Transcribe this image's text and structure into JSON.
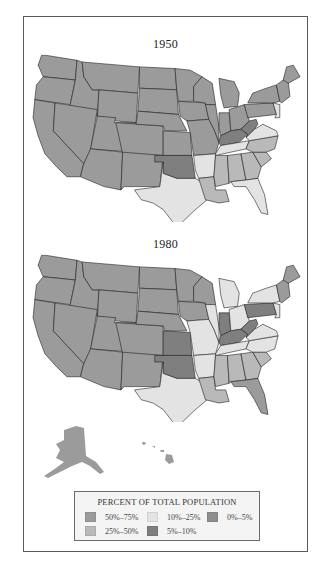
{
  "figure": {
    "maps": [
      {
        "title": "1950",
        "states": {
          "WA": "50-75",
          "OR": "50-75",
          "CA": "50-75",
          "ID": "50-75",
          "NV": "50-75",
          "MT": "50-75",
          "WY": "50-75",
          "UT": "50-75",
          "AZ": "50-75",
          "CO": "50-75",
          "NM": "50-75",
          "ND": "50-75",
          "SD": "50-75",
          "NE": "50-75",
          "KS": "50-75",
          "OK": "5-10",
          "TX": "10-25",
          "MN": "50-75",
          "IA": "50-75",
          "MO": "50-75",
          "AR": "10-25",
          "LA": "25-50",
          "WI": "50-75",
          "IL": "50-75",
          "MI": "50-75",
          "IN": "50-75",
          "OH": "50-75",
          "KY": "5-10",
          "TN": "10-25",
          "MS": "25-50",
          "AL": "25-50",
          "GA": "25-50",
          "FL": "10-25",
          "SC": "25-50",
          "NC": "25-50",
          "VA": "10-25",
          "WV": "5-10",
          "PA": "50-75",
          "NY": "50-75",
          "NJ": "10-25",
          "NE_NEW_ENGLAND": "50-75",
          "ME": "50-75"
        }
      },
      {
        "title": "1980",
        "states": {
          "WA": "50-75",
          "OR": "50-75",
          "CA": "50-75",
          "ID": "50-75",
          "NV": "50-75",
          "MT": "50-75",
          "WY": "50-75",
          "UT": "50-75",
          "AZ": "50-75",
          "CO": "50-75",
          "NM": "50-75",
          "ND": "50-75",
          "SD": "50-75",
          "NE": "50-75",
          "KS": "5-10",
          "OK": "5-10",
          "TX": "10-25",
          "MN": "50-75",
          "IA": "50-75",
          "MO": "10-25",
          "AR": "10-25",
          "LA": "25-50",
          "WI": "50-75",
          "IL": "10-25",
          "MI": "10-25",
          "IN": "5-10",
          "OH": "10-25",
          "KY": "5-10",
          "TN": "10-25",
          "MS": "25-50",
          "AL": "25-50",
          "GA": "25-50",
          "FL": "50-75",
          "SC": "25-50",
          "NC": "10-25",
          "VA": "10-25",
          "WV": "5-10",
          "PA": "5-10",
          "NY": "10-25",
          "NJ": "10-25",
          "NE_NEW_ENGLAND": "50-75",
          "ME": "50-75",
          "AK": "50-75",
          "HI": "50-75"
        }
      }
    ],
    "legend": {
      "title": "PERCENT OF TOTAL POPULATION",
      "items": [
        {
          "key": "50-75",
          "label": "50%–75%",
          "color": "#9b9b9b"
        },
        {
          "key": "10-25",
          "label": "10%–25%",
          "color": "#e3e3e3"
        },
        {
          "key": "0-5",
          "label": "0%–5%",
          "color": "#8e8e8e"
        },
        {
          "key": "25-50",
          "label": "25%–50%",
          "color": "#b9b9b9"
        },
        {
          "key": "5-10",
          "label": "5%–10%",
          "color": "#7f7f7f"
        }
      ]
    }
  }
}
